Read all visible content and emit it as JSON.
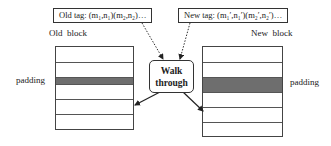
{
  "old_tag": {
    "prefix": "Old tag: ",
    "text": "(m₁,n₁)(m₂,n₂)…"
  },
  "new_tag": {
    "prefix": "New tag: ",
    "text": "(m₁′,n₁′)(m₂′,n₂′)…"
  },
  "old_block": {
    "label": "Old  block",
    "rows": 6,
    "padding_row_index": 2
  },
  "new_block": {
    "label": "New  block",
    "rows": 6,
    "padding_row_index": 2
  },
  "padding_left_label": "padding",
  "padding_right_label": "padding",
  "walk_through": {
    "line1": "Walk",
    "line2": "through"
  },
  "colors": {
    "padding_fill": "#6e6e6e",
    "stroke": "#333333"
  }
}
